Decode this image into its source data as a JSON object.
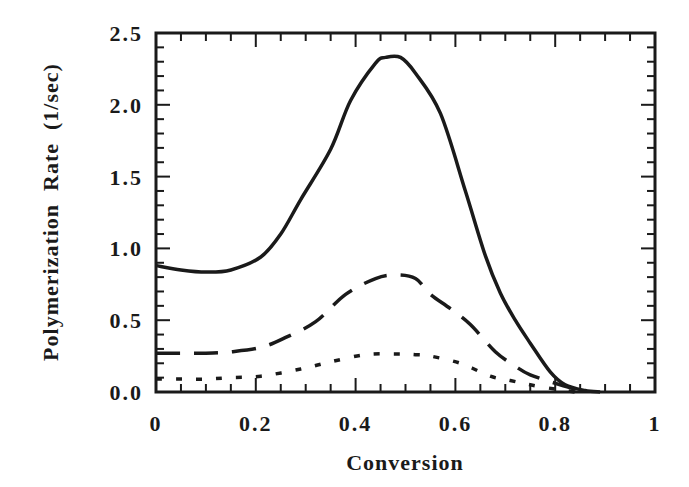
{
  "chart_data": {
    "type": "line",
    "title": "",
    "xlabel": "Conversion",
    "ylabel": "Polymerization  Rate  (1/sec)",
    "xlim": [
      0,
      1
    ],
    "ylim": [
      0,
      2.5
    ],
    "grid": false,
    "legend": null,
    "x_ticks": [
      0,
      0.2,
      0.4,
      0.6,
      0.8,
      1
    ],
    "x_tick_labels": [
      "0",
      "0.2",
      "0.4",
      "0.6",
      "0.8",
      "1"
    ],
    "y_ticks": [
      0,
      0.5,
      1.0,
      1.5,
      2.0,
      2.5
    ],
    "y_tick_labels": [
      "0.0",
      "0.5",
      "1.0",
      "1.5",
      "2.0",
      "2.5"
    ],
    "series": [
      {
        "name": "solid",
        "style": "solid",
        "x": [
          0.0,
          0.05,
          0.1,
          0.15,
          0.21,
          0.25,
          0.29,
          0.35,
          0.39,
          0.44,
          0.46,
          0.49,
          0.52,
          0.57,
          0.62,
          0.66,
          0.69,
          0.72,
          0.75,
          0.79,
          0.82,
          0.86,
          0.89
        ],
        "values": [
          0.88,
          0.85,
          0.835,
          0.85,
          0.94,
          1.1,
          1.34,
          1.69,
          2.03,
          2.29,
          2.33,
          2.33,
          2.22,
          1.94,
          1.4,
          0.95,
          0.69,
          0.5,
          0.34,
          0.14,
          0.05,
          0.01,
          0.0
        ]
      },
      {
        "name": "dashed",
        "style": "dashed",
        "x": [
          0.0,
          0.05,
          0.1,
          0.15,
          0.21,
          0.26,
          0.32,
          0.38,
          0.44,
          0.48,
          0.52,
          0.55,
          0.59,
          0.63,
          0.68,
          0.72,
          0.75,
          0.81,
          0.86
        ],
        "values": [
          0.27,
          0.27,
          0.27,
          0.28,
          0.31,
          0.38,
          0.49,
          0.68,
          0.79,
          0.815,
          0.79,
          0.68,
          0.58,
          0.47,
          0.28,
          0.18,
          0.12,
          0.05,
          0.0
        ]
      },
      {
        "name": "dotted",
        "style": "dotted",
        "x": [
          0.0,
          0.05,
          0.1,
          0.15,
          0.21,
          0.29,
          0.35,
          0.42,
          0.485,
          0.52,
          0.55,
          0.61,
          0.67,
          0.71,
          0.75,
          0.8,
          0.84
        ],
        "values": [
          0.09,
          0.09,
          0.09,
          0.1,
          0.11,
          0.16,
          0.21,
          0.26,
          0.265,
          0.26,
          0.25,
          0.2,
          0.11,
          0.08,
          0.05,
          0.02,
          0.0
        ]
      }
    ]
  }
}
